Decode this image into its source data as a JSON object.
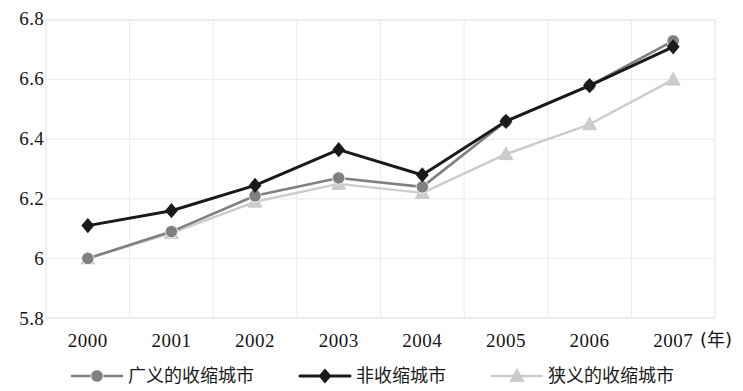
{
  "chart_data": {
    "type": "line",
    "title": "",
    "subtitle": "",
    "xlabel": "(年)",
    "ylabel": "",
    "categories": [
      "2000",
      "2001",
      "2002",
      "2003",
      "2004",
      "2005",
      "2006",
      "2007"
    ],
    "x": [
      2000,
      2001,
      2002,
      2003,
      2004,
      2005,
      2006,
      2007
    ],
    "ylim": [
      5.8,
      6.8
    ],
    "yticks": [
      "6.8",
      "6.6",
      "6.4",
      "6.2",
      "6",
      "5.8"
    ],
    "ytick_values": [
      6.8,
      6.6,
      6.4,
      6.2,
      6.0,
      5.8
    ],
    "grid": true,
    "legend_position": "bottom",
    "series": [
      {
        "name": "广义的收缩城市",
        "marker": "circle",
        "color": "#808080",
        "values": [
          6.0,
          6.09,
          6.21,
          6.27,
          6.24,
          6.46,
          6.58,
          6.73
        ]
      },
      {
        "name": "非收缩城市",
        "marker": "diamond",
        "color": "#1a1a1a",
        "values": [
          6.11,
          6.16,
          6.245,
          6.365,
          6.28,
          6.46,
          6.58,
          6.71
        ]
      },
      {
        "name": "狭义的收缩城市",
        "marker": "triangle",
        "color": "#cccccc",
        "values": [
          6.0,
          6.085,
          6.19,
          6.25,
          6.22,
          6.35,
          6.45,
          6.6
        ]
      }
    ]
  },
  "axis": {
    "x_unit_label": "(年)"
  },
  "legend": {
    "items": [
      {
        "label": "广义的收缩城市",
        "marker": "circle-marker-icon",
        "color": "#808080"
      },
      {
        "label": "非收缩城市",
        "marker": "diamond-marker-icon",
        "color": "#1a1a1a"
      },
      {
        "label": "狭义的收缩城市",
        "marker": "triangle-marker-icon",
        "color": "#cccccc"
      }
    ]
  },
  "colors": {
    "grid": "#e9e9ef",
    "frame": "#e4e4ec",
    "text": "#151515",
    "series_broad": "#808080",
    "series_nonshrink": "#1a1a1a",
    "series_narrow": "#cccccc"
  }
}
